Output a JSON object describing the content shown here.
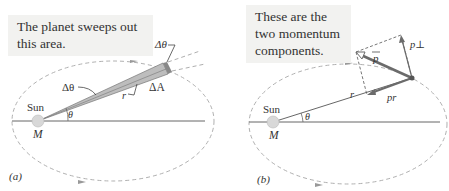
{
  "panels": [
    {
      "id": "a",
      "caption": "The planet sweeps out this area.",
      "caption_lines": [
        "The planet sweeps out",
        "this area."
      ],
      "panel_label": "(a)",
      "sun_label": "Sun",
      "mass_label": "M",
      "angle_label": "θ",
      "delta_theta_label": "Δθ",
      "r_label": "r",
      "r_delta_theta_label": "r Δθ",
      "delta_area_label": "ΔA"
    },
    {
      "id": "b",
      "caption": "These are the two momentum components.",
      "caption_lines": [
        "These are the",
        "two momentum",
        "components."
      ],
      "panel_label": "(b)",
      "sun_label": "Sun",
      "mass_label": "M",
      "angle_label": "θ",
      "r_label": "r",
      "p_label": "p",
      "p_perp_label": "p⊥",
      "p_r_label": "pr"
    }
  ],
  "colors": {
    "orbit": "#b0b0b0",
    "line": "#555555",
    "wedge_fill": "#bdbdbd",
    "vector": "#6b6b6b",
    "caption_bg": "#f2f2f0",
    "text": "#333333"
  }
}
